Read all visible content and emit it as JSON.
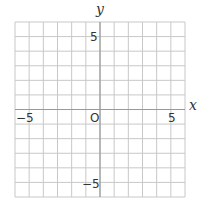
{
  "diagram": {
    "type": "coordinate-grid",
    "x_axis": {
      "label": "x",
      "min": -6,
      "max": 6,
      "tick_labels": [
        "−5",
        "5"
      ]
    },
    "y_axis": {
      "label": "y",
      "min": -6,
      "max": 6,
      "tick_labels": [
        "5",
        "−5"
      ]
    },
    "origin_label": "O",
    "grid": {
      "columns": 12,
      "rows": 12,
      "step": 1
    },
    "colors": {
      "grid": "#c8c8c8",
      "axes": "#999999",
      "text": "#333333"
    }
  }
}
